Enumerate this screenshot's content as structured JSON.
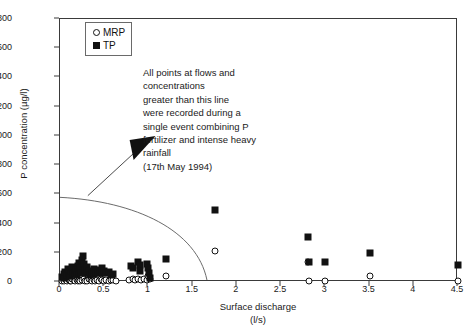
{
  "chart_data": {
    "type": "scatter",
    "title": "",
    "xlabel": "Surface discharge",
    "xlabel_units": "(l/s)",
    "ylabel": "P concentration (µg/l)",
    "xlim": [
      0,
      4.5
    ],
    "ylim": [
      0,
      1800
    ],
    "xticks": [
      "0",
      "0.5",
      "1",
      "1.5",
      "2",
      "2.5",
      "3",
      "3.5",
      "4",
      "4.5"
    ],
    "xtick_values": [
      0,
      0.5,
      1,
      1.5,
      2,
      2.5,
      3,
      3.5,
      4,
      4.5
    ],
    "yticks": [
      "0",
      "200",
      "400",
      "600",
      "800",
      "1000",
      "1200",
      "1400",
      "1600",
      "1800"
    ],
    "ytick_values": [
      0,
      200,
      400,
      600,
      800,
      1000,
      1200,
      1400,
      1600,
      1800
    ],
    "grid": false,
    "legend_position": "top-left",
    "marker_color": "#111111",
    "axis_color": "#3a3a3a",
    "series": [
      {
        "name": "MRP",
        "marker": "open-circle",
        "points": [
          [
            0.02,
            10
          ],
          [
            0.04,
            12
          ],
          [
            0.05,
            8
          ],
          [
            0.07,
            14
          ],
          [
            0.08,
            6
          ],
          [
            0.1,
            16
          ],
          [
            0.11,
            10
          ],
          [
            0.13,
            8
          ],
          [
            0.14,
            18
          ],
          [
            0.16,
            12
          ],
          [
            0.17,
            6
          ],
          [
            0.19,
            14
          ],
          [
            0.2,
            10
          ],
          [
            0.22,
            16
          ],
          [
            0.23,
            8
          ],
          [
            0.25,
            12
          ],
          [
            0.27,
            18
          ],
          [
            0.28,
            10
          ],
          [
            0.3,
            14
          ],
          [
            0.31,
            8
          ],
          [
            0.33,
            20
          ],
          [
            0.35,
            12
          ],
          [
            0.36,
            10
          ],
          [
            0.38,
            16
          ],
          [
            0.4,
            8
          ],
          [
            0.42,
            14
          ],
          [
            0.44,
            10
          ],
          [
            0.46,
            18
          ],
          [
            0.48,
            12
          ],
          [
            0.5,
            10
          ],
          [
            0.52,
            14
          ],
          [
            0.55,
            8
          ],
          [
            0.58,
            12
          ],
          [
            0.6,
            16
          ],
          [
            0.63,
            10
          ],
          [
            0.78,
            14
          ],
          [
            0.82,
            18
          ],
          [
            0.85,
            12
          ],
          [
            0.88,
            22
          ],
          [
            0.92,
            16
          ],
          [
            0.95,
            20
          ],
          [
            0.98,
            14
          ],
          [
            1.0,
            40
          ],
          [
            1.02,
            18
          ],
          [
            1.2,
            40
          ],
          [
            1.75,
            215
          ],
          [
            2.8,
            140
          ],
          [
            2.82,
            10
          ],
          [
            3.0,
            5
          ],
          [
            3.5,
            40
          ],
          [
            4.5,
            5
          ]
        ]
      },
      {
        "name": "TP",
        "marker": "filled-square",
        "points": [
          [
            0.02,
            35
          ],
          [
            0.04,
            55
          ],
          [
            0.05,
            30
          ],
          [
            0.06,
            70
          ],
          [
            0.08,
            45
          ],
          [
            0.09,
            90
          ],
          [
            0.1,
            60
          ],
          [
            0.11,
            40
          ],
          [
            0.13,
            75
          ],
          [
            0.14,
            100
          ],
          [
            0.15,
            55
          ],
          [
            0.17,
            65
          ],
          [
            0.18,
            85
          ],
          [
            0.19,
            50
          ],
          [
            0.2,
            110
          ],
          [
            0.21,
            70
          ],
          [
            0.22,
            130
          ],
          [
            0.23,
            95
          ],
          [
            0.24,
            60
          ],
          [
            0.25,
            150
          ],
          [
            0.26,
            175
          ],
          [
            0.27,
            120
          ],
          [
            0.28,
            80
          ],
          [
            0.3,
            100
          ],
          [
            0.31,
            60
          ],
          [
            0.33,
            75
          ],
          [
            0.34,
            45
          ],
          [
            0.36,
            65
          ],
          [
            0.38,
            90
          ],
          [
            0.39,
            55
          ],
          [
            0.41,
            70
          ],
          [
            0.43,
            60
          ],
          [
            0.45,
            80
          ],
          [
            0.47,
            95
          ],
          [
            0.48,
            65
          ],
          [
            0.5,
            75
          ],
          [
            0.52,
            60
          ],
          [
            0.55,
            70
          ],
          [
            0.58,
            50
          ],
          [
            0.6,
            55
          ],
          [
            0.8,
            110
          ],
          [
            0.82,
            95
          ],
          [
            0.88,
            135
          ],
          [
            0.9,
            115
          ],
          [
            0.91,
            75
          ],
          [
            0.98,
            125
          ],
          [
            1.0,
            95
          ],
          [
            1.01,
            60
          ],
          [
            1.02,
            30
          ],
          [
            1.2,
            155
          ],
          [
            1.75,
            490
          ],
          [
            2.8,
            310
          ],
          [
            2.82,
            140
          ],
          [
            3.0,
            140
          ],
          [
            3.5,
            200
          ],
          [
            4.5,
            115
          ]
        ]
      }
    ],
    "annotations": [
      {
        "name": "event-note",
        "lines": [
          "All points at flows and",
          "concentrations",
          "greater than this line",
          "were recorded during a",
          "single event combining P",
          "fertilizer and intense heavy",
          "rainfall",
          "(17th May 1994)"
        ]
      }
    ],
    "threshold_curve": {
      "name": "threshold-arc",
      "description": "quarter-arc boundary from y-axis at 570 ug/l to x-axis at 1.67 l/s",
      "y_intercept": 570,
      "x_intercept": 1.67,
      "color": "#6a6a6a"
    },
    "leader_arrow": {
      "name": "annotation-arrow",
      "points_to": "event-note"
    }
  },
  "legend": {
    "items": [
      {
        "label": "MRP",
        "marker": "open-circle",
        "icon": "circle-outline-icon"
      },
      {
        "label": "TP",
        "marker": "filled-square",
        "icon": "square-filled-icon"
      }
    ]
  }
}
